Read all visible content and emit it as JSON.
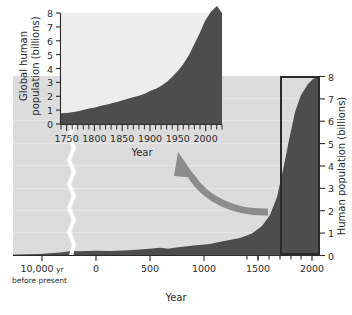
{
  "figure": {
    "name": "human-population-growth-figure",
    "colors": {
      "data_fill": "#4d4d4d",
      "main_plot_background": "#dcdcdc",
      "inset_plot_background": "#ededed",
      "axis": "#2b2b2b",
      "arrow": "#8c8c8c",
      "highlight_box_border": "#2b2b2b",
      "page_background": "#ffffff"
    }
  },
  "main_chart": {
    "xlabel": "Year",
    "ylabel": "Human population (billions)",
    "x_tick_labels": [
      "10,000 yr",
      "0",
      "500",
      "1000",
      "1500",
      "2000"
    ],
    "break_sublabel": "before present",
    "y_tick_labels": [
      "0",
      "1",
      "2",
      "3",
      "4",
      "5",
      "6",
      "7",
      "8"
    ]
  },
  "inset_chart": {
    "xlabel": "Year",
    "ylabel_line1": "Global human",
    "ylabel_line2": "population (billions)",
    "ylabel": "Global human population (billions)",
    "x_tick_labels": [
      "1750",
      "1800",
      "1850",
      "1900",
      "1950",
      "2000"
    ],
    "y_tick_labels": [
      "0",
      "1",
      "2",
      "3",
      "4",
      "5",
      "6",
      "7",
      "8"
    ]
  },
  "annotations": {
    "arrow_name": "curved-zoom-arrow",
    "highlight_box_name": "inset-source-highlight-box"
  },
  "chart_data": {
    "type": "area",
    "title": "",
    "charts": [
      {
        "id": "main",
        "type": "area",
        "title": "",
        "xlabel": "Year",
        "ylabel": "Human population (billions)",
        "xlim": [
          -10000,
          2100
        ],
        "ylim": [
          0,
          8
        ],
        "axis_break_at": -300,
        "grid": true,
        "x_ticks": [
          -10000,
          0,
          500,
          1000,
          1500,
          2000
        ],
        "x_tick_labels": [
          "10,000 yr",
          "0",
          "500",
          "1000",
          "1500",
          "2000"
        ],
        "x_minor_ticks": [
          1600,
          1700,
          1800,
          1900,
          2000
        ],
        "y_ticks": [
          0,
          1,
          2,
          3,
          4,
          5,
          6,
          7,
          8
        ],
        "y_tick_labels": [
          "0",
          "1",
          "2",
          "3",
          "4",
          "5",
          "6",
          "7",
          "8"
        ],
        "x": [
          -10000,
          -8000,
          -6000,
          -4000,
          -2000,
          -1000,
          -500,
          0,
          200,
          400,
          600,
          800,
          1000,
          1200,
          1300,
          1400,
          1500,
          1600,
          1700,
          1750,
          1800,
          1850,
          1900,
          1927,
          1950,
          1960,
          1974,
          1987,
          1999,
          2011,
          2023
        ],
        "y": [
          0.004,
          0.01,
          0.02,
          0.04,
          0.07,
          0.12,
          0.15,
          0.2,
          0.22,
          0.2,
          0.21,
          0.24,
          0.3,
          0.4,
          0.43,
          0.38,
          0.45,
          0.55,
          0.6,
          0.79,
          0.98,
          1.26,
          1.65,
          2.0,
          2.5,
          3.0,
          4.0,
          5.0,
          6.0,
          7.0,
          8.0
        ],
        "series_name": "World population"
      },
      {
        "id": "inset",
        "type": "area",
        "title": "",
        "xlabel": "Year",
        "ylabel": "Global human population (billions)",
        "xlim": [
          1740,
          2030
        ],
        "ylim": [
          0,
          8
        ],
        "grid": false,
        "x_ticks": [
          1750,
          1800,
          1850,
          1900,
          1950,
          2000
        ],
        "x_tick_labels": [
          "1750",
          "1800",
          "1850",
          "1900",
          "1950",
          "2000"
        ],
        "x_minor_tick_interval": 10,
        "y_ticks": [
          0,
          1,
          2,
          3,
          4,
          5,
          6,
          7,
          8
        ],
        "y_tick_labels": [
          "0",
          "1",
          "2",
          "3",
          "4",
          "5",
          "6",
          "7",
          "8"
        ],
        "x": [
          1740,
          1750,
          1760,
          1770,
          1780,
          1790,
          1800,
          1810,
          1820,
          1830,
          1840,
          1850,
          1860,
          1870,
          1880,
          1890,
          1900,
          1910,
          1920,
          1930,
          1940,
          1950,
          1960,
          1970,
          1980,
          1990,
          2000,
          2010,
          2020
        ],
        "y": [
          0.77,
          0.79,
          0.81,
          0.84,
          0.87,
          0.92,
          0.98,
          1.03,
          1.09,
          1.15,
          1.2,
          1.26,
          1.33,
          1.39,
          1.46,
          1.53,
          1.65,
          1.75,
          1.86,
          2.07,
          2.3,
          2.54,
          3.03,
          3.7,
          4.45,
          5.32,
          6.15,
          6.96,
          7.4
        ],
        "series_name": "World population"
      }
    ]
  }
}
